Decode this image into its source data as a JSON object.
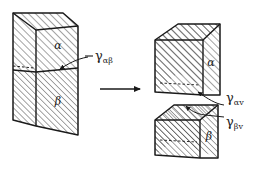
{
  "figure": {
    "background_color": "#ffffff",
    "line_color": "#1a1a1a",
    "hatch_color": "#333333"
  },
  "left_block": {
    "name": "joined-bicrystal",
    "upper_phase_label": "α",
    "lower_phase_label": "β",
    "interface_label_main": "γ",
    "interface_label_sub": "αβ"
  },
  "arrow": {
    "name": "transformation-arrow",
    "direction": "right"
  },
  "right_upper_block": {
    "name": "separated-alpha-block",
    "phase_label": "α",
    "surface_label_main": "γ",
    "surface_label_sub": "αv"
  },
  "right_lower_block": {
    "name": "separated-beta-block",
    "phase_label": "β",
    "surface_label_main": "γ",
    "surface_label_sub": "βv"
  }
}
